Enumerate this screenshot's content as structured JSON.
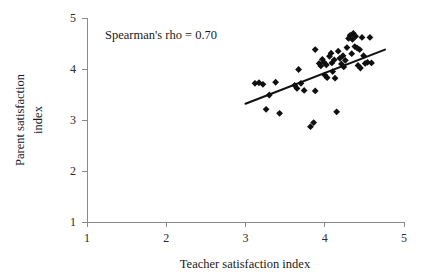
{
  "chart_data": {
    "type": "scatter",
    "title": "",
    "xlabel": "Teacher satisfaction index",
    "ylabel_line1": "Parent satisfaction",
    "ylabel_line2": "index",
    "xlim": [
      1,
      5
    ],
    "ylim": [
      1,
      5
    ],
    "xticks": [
      1,
      2,
      3,
      4,
      5
    ],
    "yticks": [
      1,
      2,
      3,
      4,
      5
    ],
    "xtick_labels": [
      "1",
      "2",
      "3",
      "4",
      "5"
    ],
    "ytick_labels": [
      "1",
      "2",
      "3",
      "4",
      "5"
    ],
    "grid": false,
    "legend": false,
    "annotation": "Spearman's rho = 0.70",
    "marker": "diamond",
    "marker_color": "#101010",
    "trendline": {
      "visible": true,
      "color": "#111111",
      "x_start": 3.0,
      "y_start": 3.32,
      "x_end": 4.76,
      "y_end": 4.38
    },
    "points": [
      {
        "x": 3.12,
        "y": 3.72
      },
      {
        "x": 3.17,
        "y": 3.73
      },
      {
        "x": 3.22,
        "y": 3.7
      },
      {
        "x": 3.26,
        "y": 3.21
      },
      {
        "x": 3.3,
        "y": 3.49
      },
      {
        "x": 3.38,
        "y": 3.74
      },
      {
        "x": 3.43,
        "y": 3.13
      },
      {
        "x": 3.62,
        "y": 3.68
      },
      {
        "x": 3.65,
        "y": 3.62
      },
      {
        "x": 3.67,
        "y": 3.99
      },
      {
        "x": 3.7,
        "y": 3.72
      },
      {
        "x": 3.74,
        "y": 3.58
      },
      {
        "x": 3.82,
        "y": 2.87
      },
      {
        "x": 3.86,
        "y": 2.95
      },
      {
        "x": 3.88,
        "y": 4.38
      },
      {
        "x": 3.88,
        "y": 3.57
      },
      {
        "x": 3.93,
        "y": 4.11
      },
      {
        "x": 3.95,
        "y": 4.06
      },
      {
        "x": 3.97,
        "y": 4.19
      },
      {
        "x": 3.99,
        "y": 4.13
      },
      {
        "x": 4.0,
        "y": 3.88
      },
      {
        "x": 4.02,
        "y": 4.08
      },
      {
        "x": 4.03,
        "y": 3.83
      },
      {
        "x": 4.06,
        "y": 4.25
      },
      {
        "x": 4.08,
        "y": 4.31
      },
      {
        "x": 4.09,
        "y": 4.12
      },
      {
        "x": 4.1,
        "y": 3.95
      },
      {
        "x": 4.12,
        "y": 4.18
      },
      {
        "x": 4.13,
        "y": 3.82
      },
      {
        "x": 4.15,
        "y": 3.16
      },
      {
        "x": 4.17,
        "y": 4.35
      },
      {
        "x": 4.19,
        "y": 4.21
      },
      {
        "x": 4.21,
        "y": 4.1
      },
      {
        "x": 4.23,
        "y": 4.26
      },
      {
        "x": 4.24,
        "y": 4.04
      },
      {
        "x": 4.26,
        "y": 4.17
      },
      {
        "x": 4.28,
        "y": 4.42
      },
      {
        "x": 4.3,
        "y": 4.6
      },
      {
        "x": 4.32,
        "y": 4.66
      },
      {
        "x": 4.34,
        "y": 4.3
      },
      {
        "x": 4.35,
        "y": 4.58
      },
      {
        "x": 4.36,
        "y": 4.7
      },
      {
        "x": 4.38,
        "y": 4.44
      },
      {
        "x": 4.39,
        "y": 4.64
      },
      {
        "x": 4.41,
        "y": 4.41
      },
      {
        "x": 4.42,
        "y": 4.07
      },
      {
        "x": 4.44,
        "y": 4.38
      },
      {
        "x": 4.45,
        "y": 4.02
      },
      {
        "x": 4.47,
        "y": 4.62
      },
      {
        "x": 4.49,
        "y": 4.26
      },
      {
        "x": 4.51,
        "y": 4.11
      },
      {
        "x": 4.54,
        "y": 4.13
      },
      {
        "x": 4.57,
        "y": 4.62
      },
      {
        "x": 4.59,
        "y": 4.12
      }
    ]
  }
}
